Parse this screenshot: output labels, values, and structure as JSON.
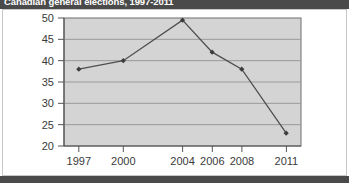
{
  "title": "Canadian general elections, 1997-2011",
  "chart_data": {
    "type": "line",
    "title": "Canadian general elections, 1997-2011",
    "xlabel": "",
    "ylabel": "",
    "x": [
      1997,
      2000,
      2004,
      2006,
      2008,
      2011
    ],
    "categories": [
      "1997",
      "2000",
      "2004",
      "2006",
      "2008",
      "2011"
    ],
    "values": [
      38,
      40,
      49.5,
      42,
      38,
      23
    ],
    "series": [
      {
        "name": "series-1",
        "values": [
          38,
          40,
          49.5,
          42,
          38,
          23
        ]
      }
    ],
    "ylim": [
      20,
      50
    ],
    "yticks": [
      20,
      25,
      30,
      35,
      40,
      45,
      50
    ],
    "ytick_labels": [
      "20",
      "25",
      "30",
      "35",
      "40",
      "45",
      "50"
    ],
    "xlim": [
      1996,
      2012
    ],
    "xticks": [
      1997,
      2000,
      2004,
      2006,
      2008,
      2011
    ],
    "xtick_labels": [
      "1997",
      "2000",
      "2004",
      "2006",
      "2008",
      "2011"
    ],
    "grid": true,
    "grid_axis": "y",
    "legend": false,
    "legend_position": "none",
    "markers": "diamond",
    "plot_background": "#d4d4d4",
    "line_color": "#4f4f4f",
    "marker_color": "#3c3c3c",
    "grid_color": "#9a9a9a",
    "axis_color": "#555555"
  }
}
